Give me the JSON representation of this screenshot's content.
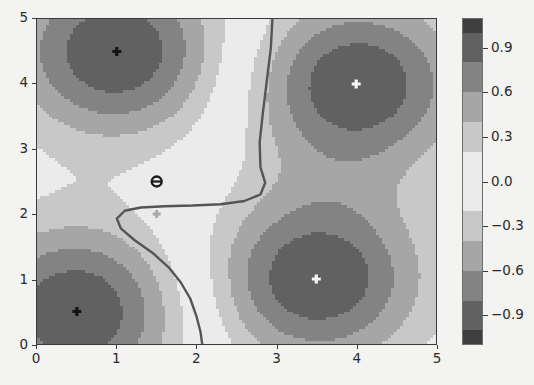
{
  "figure": {
    "background_color": "#f3f3f1",
    "axes_frame_color": "#3a3a3a"
  },
  "chart_data": {
    "type": "heatmap",
    "subtype": "filled-contour",
    "title": "",
    "xlabel": "",
    "ylabel": "",
    "xlim": [
      0,
      5
    ],
    "ylim": [
      0,
      5
    ],
    "grid": false,
    "legend": null,
    "xticks": [
      0,
      1,
      2,
      3,
      4,
      5
    ],
    "xticklabels": [
      "0",
      "1",
      "2",
      "3",
      "4",
      "5"
    ],
    "yticks": [
      0,
      1,
      2,
      3,
      4,
      5
    ],
    "yticklabels": [
      "0",
      "1",
      "2",
      "3",
      "4",
      "5"
    ],
    "colorbar": {
      "orientation": "vertical",
      "vmin": -1.1,
      "vmax": 1.1,
      "ticks": [
        0.9,
        0.6,
        0.3,
        0.0,
        -0.3,
        -0.6,
        -0.9
      ],
      "ticklabels": [
        "0.9",
        "0.6",
        "0.3",
        "0.0",
        "-0.3",
        "-0.6",
        "-0.9"
      ],
      "colormap": "symmetric-gray (dark at both extremes, light at zero)"
    },
    "contour_levels": [
      -1.0,
      -0.8,
      -0.6,
      -0.4,
      -0.2,
      0.0,
      0.2,
      0.4,
      0.6,
      0.8,
      1.0
    ],
    "decision_boundary": {
      "level": 0.0,
      "color": "#555555",
      "linewidth": 2.4,
      "path_xy": [
        [
          2.95,
          5.0
        ],
        [
          2.93,
          4.55
        ],
        [
          2.88,
          4.05
        ],
        [
          2.83,
          3.55
        ],
        [
          2.79,
          3.1
        ],
        [
          2.8,
          2.72
        ],
        [
          2.86,
          2.48
        ],
        [
          2.8,
          2.3
        ],
        [
          2.6,
          2.2
        ],
        [
          2.3,
          2.15
        ],
        [
          1.95,
          2.13
        ],
        [
          1.6,
          2.12
        ],
        [
          1.3,
          2.1
        ],
        [
          1.1,
          2.05
        ],
        [
          1.0,
          1.93
        ],
        [
          1.05,
          1.78
        ],
        [
          1.22,
          1.6
        ],
        [
          1.45,
          1.4
        ],
        [
          1.65,
          1.18
        ],
        [
          1.8,
          0.95
        ],
        [
          1.92,
          0.7
        ],
        [
          2.0,
          0.42
        ],
        [
          2.05,
          0.18
        ],
        [
          2.07,
          0.0
        ]
      ]
    },
    "peaks": [
      {
        "x": 1.0,
        "y": 4.5,
        "value": -1.0,
        "label": "negative-peak-top-left"
      },
      {
        "x": 0.5,
        "y": 0.5,
        "value": -1.0,
        "label": "negative-peak-bottom-left"
      },
      {
        "x": 4.0,
        "y": 4.0,
        "value": 1.0,
        "label": "positive-peak-top-right"
      },
      {
        "x": 3.5,
        "y": 1.0,
        "value": 1.0,
        "label": "positive-peak-bottom-right"
      }
    ],
    "markers": [
      {
        "x": 1.0,
        "y": 4.5,
        "shape": "plus",
        "color": "#141414",
        "size": 9,
        "name": "marker-negative-a"
      },
      {
        "x": 0.5,
        "y": 0.5,
        "shape": "plus",
        "color": "#141414",
        "size": 9,
        "name": "marker-negative-b"
      },
      {
        "x": 4.0,
        "y": 4.0,
        "shape": "plus",
        "color": "#f6f6f6",
        "size": 9,
        "name": "marker-positive-a"
      },
      {
        "x": 3.5,
        "y": 1.0,
        "shape": "plus",
        "color": "#f6f6f6",
        "size": 9,
        "name": "marker-positive-b"
      },
      {
        "x": 1.5,
        "y": 2.5,
        "shape": "circle-minus",
        "color": "#1a1a1a",
        "size": 10,
        "name": "marker-query-dark"
      },
      {
        "x": 1.5,
        "y": 2.0,
        "shape": "plus",
        "color": "#a9a9a9",
        "size": 8,
        "name": "marker-query-light"
      }
    ]
  }
}
